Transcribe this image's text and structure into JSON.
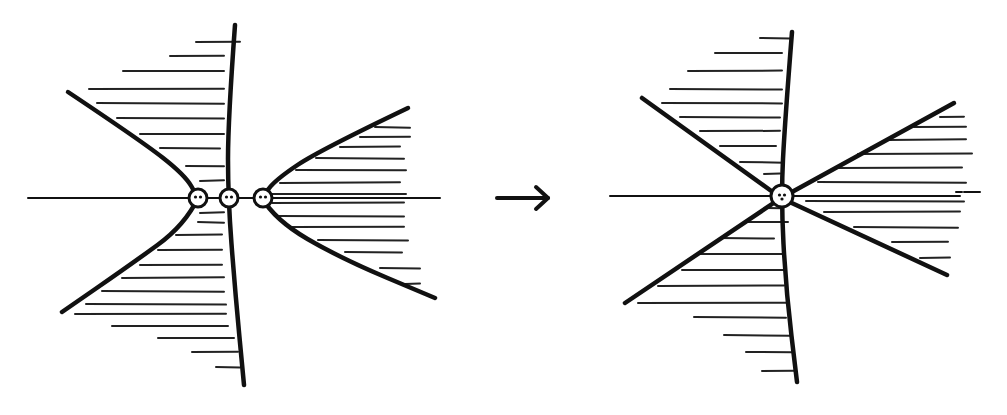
{
  "diagram": {
    "background": "#ffffff",
    "ink": "#111111",
    "arrow": {
      "from": [
        497,
        198
      ],
      "to": [
        548,
        198
      ],
      "meaning": "transition / merge"
    },
    "left_panel": {
      "axis": {
        "x1": 28,
        "x2": 440,
        "y": 198
      },
      "vertical_curve": [
        [
          235,
          25
        ],
        [
          228,
          120
        ],
        [
          228,
          198
        ],
        [
          235,
          290
        ],
        [
          244,
          385
        ]
      ],
      "left_branch_upper": [
        [
          68,
          92
        ],
        [
          140,
          140
        ],
        [
          185,
          175
        ],
        [
          198,
          198
        ]
      ],
      "left_branch_lower": [
        [
          198,
          198
        ],
        [
          185,
          225
        ],
        [
          130,
          265
        ],
        [
          62,
          312
        ]
      ],
      "right_branch_upper": [
        [
          408,
          108
        ],
        [
          320,
          150
        ],
        [
          275,
          180
        ],
        [
          262,
          198
        ]
      ],
      "right_branch_lower": [
        [
          262,
          198
        ],
        [
          275,
          220
        ],
        [
          340,
          258
        ],
        [
          435,
          298
        ]
      ],
      "singular_points": [
        {
          "cx": 198,
          "cy": 198,
          "r": 9
        },
        {
          "cx": 229,
          "cy": 198,
          "r": 9
        },
        {
          "cx": 263,
          "cy": 198,
          "r": 9
        }
      ],
      "hatch_lines_left": [
        {
          "y": 42,
          "x1": 196,
          "x2": 240
        },
        {
          "y": 56,
          "x1": 170,
          "x2": 224
        },
        {
          "y": 71,
          "x1": 123,
          "x2": 224
        },
        {
          "y": 89,
          "x1": 89,
          "x2": 224
        },
        {
          "y": 103,
          "x1": 97,
          "x2": 224
        },
        {
          "y": 118,
          "x1": 117,
          "x2": 224
        },
        {
          "y": 134,
          "x1": 140,
          "x2": 224
        },
        {
          "y": 148,
          "x1": 160,
          "x2": 220
        },
        {
          "y": 166,
          "x1": 186,
          "x2": 224
        },
        {
          "y": 181,
          "x1": 200,
          "x2": 224
        },
        {
          "y": 213,
          "x1": 200,
          "x2": 224
        },
        {
          "y": 222,
          "x1": 198,
          "x2": 224
        },
        {
          "y": 235,
          "x1": 176,
          "x2": 222
        },
        {
          "y": 250,
          "x1": 158,
          "x2": 222
        },
        {
          "y": 265,
          "x1": 140,
          "x2": 222
        },
        {
          "y": 278,
          "x1": 122,
          "x2": 224
        },
        {
          "y": 291,
          "x1": 102,
          "x2": 224
        },
        {
          "y": 304,
          "x1": 86,
          "x2": 226
        },
        {
          "y": 314,
          "x1": 75,
          "x2": 226
        },
        {
          "y": 326,
          "x1": 112,
          "x2": 228
        },
        {
          "y": 338,
          "x1": 158,
          "x2": 234
        },
        {
          "y": 352,
          "x1": 192,
          "x2": 238
        },
        {
          "y": 367,
          "x1": 216,
          "x2": 240
        }
      ],
      "hatch_lines_right": [
        {
          "y": 127,
          "x1": 375,
          "x2": 410
        },
        {
          "y": 137,
          "x1": 360,
          "x2": 410
        },
        {
          "y": 147,
          "x1": 340,
          "x2": 400
        },
        {
          "y": 158,
          "x1": 316,
          "x2": 404
        },
        {
          "y": 170,
          "x1": 296,
          "x2": 406
        },
        {
          "y": 183,
          "x1": 280,
          "x2": 400
        },
        {
          "y": 194,
          "x1": 272,
          "x2": 406
        },
        {
          "y": 203,
          "x1": 272,
          "x2": 404
        },
        {
          "y": 216,
          "x1": 278,
          "x2": 404
        },
        {
          "y": 227,
          "x1": 292,
          "x2": 404
        },
        {
          "y": 240,
          "x1": 318,
          "x2": 408
        },
        {
          "y": 252,
          "x1": 345,
          "x2": 402
        },
        {
          "y": 268,
          "x1": 380,
          "x2": 420
        },
        {
          "y": 284,
          "x1": 405,
          "x2": 420
        }
      ]
    },
    "right_panel": {
      "axis": {
        "x1": 610,
        "x2": 960,
        "y": 196
      },
      "axis_tail_dashes": [
        {
          "x1": 956,
          "x2": 962,
          "y": 192
        },
        {
          "x1": 964,
          "x2": 980,
          "y": 192
        }
      ],
      "vertical_curve": [
        [
          792,
          32
        ],
        [
          785,
          120
        ],
        [
          781,
          198
        ],
        [
          786,
          290
        ],
        [
          797,
          382
        ]
      ],
      "line_upper_left": [
        [
          642,
          98
        ],
        [
          781,
          198
        ]
      ],
      "line_lower_right": [
        [
          781,
          198
        ],
        [
          947,
          275
        ]
      ],
      "line_upper_right": [
        [
          954,
          103
        ],
        [
          781,
          198
        ]
      ],
      "line_lower_left": [
        [
          781,
          198
        ],
        [
          625,
          303
        ]
      ],
      "singular_points": [
        {
          "cx": 782,
          "cy": 196,
          "r": 11
        }
      ],
      "hatch_lines_left": [
        {
          "y": 38,
          "x1": 760,
          "x2": 790
        },
        {
          "y": 53,
          "x1": 715,
          "x2": 782
        },
        {
          "y": 71,
          "x1": 688,
          "x2": 782
        },
        {
          "y": 89,
          "x1": 670,
          "x2": 782
        },
        {
          "y": 103,
          "x1": 662,
          "x2": 782
        },
        {
          "y": 117,
          "x1": 680,
          "x2": 780
        },
        {
          "y": 131,
          "x1": 700,
          "x2": 780
        },
        {
          "y": 146,
          "x1": 720,
          "x2": 776
        },
        {
          "y": 162,
          "x1": 740,
          "x2": 784
        },
        {
          "y": 174,
          "x1": 764,
          "x2": 780
        },
        {
          "y": 208,
          "x1": 766,
          "x2": 782
        },
        {
          "y": 222,
          "x1": 744,
          "x2": 788
        },
        {
          "y": 238,
          "x1": 720,
          "x2": 774
        },
        {
          "y": 254,
          "x1": 700,
          "x2": 782
        },
        {
          "y": 270,
          "x1": 682,
          "x2": 784
        },
        {
          "y": 286,
          "x1": 658,
          "x2": 784
        },
        {
          "y": 303,
          "x1": 638,
          "x2": 786
        },
        {
          "y": 317,
          "x1": 694,
          "x2": 786
        },
        {
          "y": 335,
          "x1": 724,
          "x2": 790
        },
        {
          "y": 352,
          "x1": 746,
          "x2": 792
        },
        {
          "y": 371,
          "x1": 762,
          "x2": 794
        }
      ],
      "hatch_lines_right": [
        {
          "y": 117,
          "x1": 940,
          "x2": 964
        },
        {
          "y": 127,
          "x1": 914,
          "x2": 966
        },
        {
          "y": 140,
          "x1": 888,
          "x2": 966
        },
        {
          "y": 154,
          "x1": 858,
          "x2": 972
        },
        {
          "y": 168,
          "x1": 836,
          "x2": 962
        },
        {
          "y": 182,
          "x1": 818,
          "x2": 966
        },
        {
          "y": 201,
          "x1": 806,
          "x2": 964
        },
        {
          "y": 212,
          "x1": 824,
          "x2": 960
        },
        {
          "y": 227,
          "x1": 854,
          "x2": 958
        },
        {
          "y": 242,
          "x1": 892,
          "x2": 948
        },
        {
          "y": 258,
          "x1": 920,
          "x2": 950
        }
      ]
    }
  }
}
